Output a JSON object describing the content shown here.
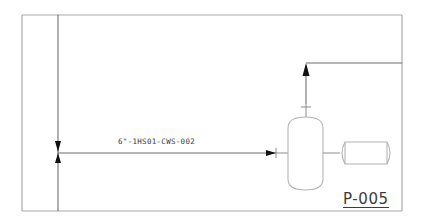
{
  "diagram": {
    "type": "P&ID fragment",
    "line": {
      "label": "6\"-1HS01-CWS-002",
      "flow_direction": "left-to-right"
    },
    "equipment": [
      {
        "id": "vessel",
        "shape": "vertical-capsule"
      },
      {
        "id": "horizontal-tank",
        "shape": "horizontal-capsule"
      }
    ],
    "outlet": {
      "direction": "up-then-right"
    },
    "drawing_reference": "P-005",
    "colors": {
      "frame": "#a8a8a8",
      "pipe": "#6e6e6e",
      "equipment_outline": "#b4b4b4",
      "arrowhead": "#111111",
      "text": "#3a3a3a"
    }
  }
}
